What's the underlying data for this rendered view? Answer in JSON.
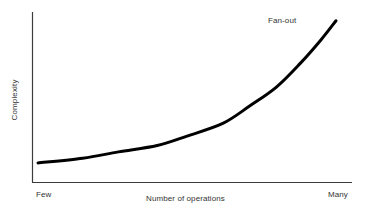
{
  "chart_data": {
    "type": "line",
    "title": "",
    "subtitle": "",
    "xlabel": "Number of operations",
    "ylabel": "Complexity",
    "xtick_labels": [
      "Few",
      "Many"
    ],
    "ytick_labels": [],
    "grid": false,
    "legend": false,
    "legend_position": "none",
    "annotations": [
      {
        "text": "Fan-out",
        "target_series": "Fan-out",
        "x_fraction": 0.92,
        "y_fraction": 0.97
      }
    ],
    "axis_ranges": {
      "x": [
        "Few",
        "Many"
      ],
      "y": [
        "low",
        "high"
      ]
    },
    "series": [
      {
        "name": "Fan-out",
        "color": "#000000",
        "line_width": 3,
        "x": [
          0.0,
          0.15,
          0.27,
          0.4,
          0.5,
          0.62,
          0.71,
          0.8,
          0.88,
          0.95,
          1.0
        ],
        "y": [
          0.07,
          0.1,
          0.14,
          0.18,
          0.24,
          0.32,
          0.43,
          0.55,
          0.7,
          0.85,
          0.97
        ]
      }
    ]
  },
  "figure": {
    "background_color": "#ffffff",
    "axis_color": "#3c3c3c",
    "text_color": "#343434",
    "curve_color": "#000000"
  }
}
